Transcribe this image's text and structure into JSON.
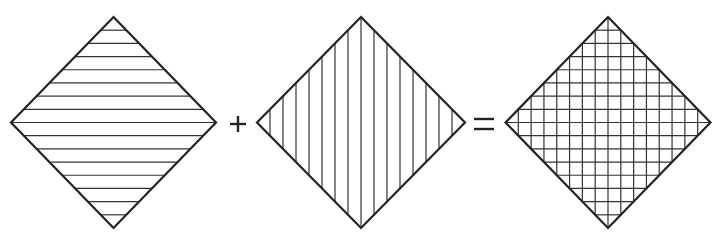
{
  "diagram": {
    "title": "",
    "stroke_color": "#222222",
    "hatch_color": "#333333",
    "background": "#ffffff",
    "shapes": [
      {
        "id": "diamond-horizontal",
        "cx": 113.5,
        "cy": 122.5,
        "half_w": 102.5,
        "half_h": 105.5,
        "pattern": "horizontal",
        "line_count": 15
      },
      {
        "id": "diamond-vertical",
        "cx": 361,
        "cy": 122.5,
        "half_w": 104,
        "half_h": 105.5,
        "pattern": "vertical",
        "line_count": 15
      },
      {
        "id": "diamond-crosshatch",
        "cx": 608,
        "cy": 122.5,
        "half_w": 102.5,
        "half_h": 105.5,
        "pattern": "grid",
        "line_count": 15
      }
    ],
    "operators": [
      {
        "id": "plus-sign",
        "symbol": "+",
        "cx": 238,
        "cy": 124
      },
      {
        "id": "equals-sign",
        "symbol": "=",
        "cx": 484,
        "cy": 124
      }
    ]
  }
}
